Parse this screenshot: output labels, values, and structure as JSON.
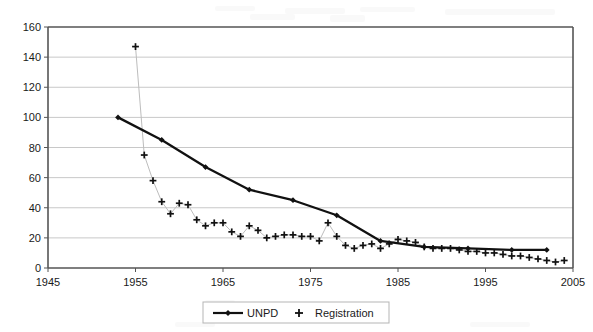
{
  "chart_data": {
    "type": "line",
    "title": "",
    "subtitle": "",
    "xlabel": "",
    "ylabel": "",
    "xlim": [
      1945,
      2005
    ],
    "ylim": [
      0,
      160
    ],
    "xticks": [
      1945,
      1955,
      1965,
      1975,
      1985,
      1995,
      2005
    ],
    "yticks": [
      0,
      20,
      40,
      60,
      80,
      100,
      120,
      140,
      160
    ],
    "grid": "horizontal",
    "legend_position": "bottom-center",
    "series": [
      {
        "name": "UNPD",
        "marker": "diamond",
        "line": true,
        "x": [
          1953,
          1958,
          1963,
          1968,
          1973,
          1978,
          1983,
          1988,
          1993,
          1998,
          2002
        ],
        "values": [
          100,
          85,
          67,
          52,
          45,
          35,
          18,
          14,
          13,
          12,
          12
        ]
      },
      {
        "name": "Registration",
        "marker": "plus",
        "line": false,
        "x": [
          1955,
          1956,
          1957,
          1958,
          1959,
          1960,
          1961,
          1962,
          1963,
          1964,
          1965,
          1966,
          1967,
          1968,
          1969,
          1970,
          1971,
          1972,
          1973,
          1974,
          1975,
          1976,
          1977,
          1978,
          1979,
          1980,
          1981,
          1982,
          1983,
          1984,
          1985,
          1986,
          1987,
          1988,
          1989,
          1990,
          1991,
          1992,
          1993,
          1994,
          1995,
          1996,
          1997,
          1998,
          1999,
          2000,
          2001,
          2002,
          2003,
          2004
        ],
        "values": [
          147,
          75,
          58,
          44,
          36,
          43,
          42,
          32,
          28,
          30,
          30,
          24,
          21,
          28,
          25,
          20,
          21,
          22,
          22,
          21,
          21,
          18,
          30,
          21,
          15,
          13,
          15,
          16,
          13,
          16,
          19,
          18,
          17,
          14,
          13,
          13,
          13,
          12,
          11,
          11,
          10,
          10,
          9,
          8,
          8,
          7,
          6,
          5,
          4,
          5
        ]
      }
    ]
  },
  "legend": {
    "entries": [
      {
        "label": "UNPD",
        "marker": "diamond-line",
        "color": "#111111"
      },
      {
        "label": "Registration",
        "marker": "plus",
        "color": "#111111"
      }
    ]
  },
  "axes": {
    "y_labels": [
      "160",
      "140",
      "120",
      "100",
      "80",
      "60",
      "40",
      "20",
      "0"
    ],
    "x_labels": [
      "1945",
      "1955",
      "1965",
      "1975",
      "1985",
      "1995",
      "2005"
    ]
  },
  "colors": {
    "background": "#ffffff",
    "grid": "#c8c8c8",
    "axis": "#555555",
    "unpd": "#111111",
    "registration": "#bdbdbd",
    "text": "#1a1a1a"
  }
}
